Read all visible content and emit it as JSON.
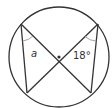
{
  "diagram": {
    "type": "circle-inscribed-angles",
    "colors": {
      "stroke": "#333333",
      "background": "#ffffff",
      "arc": "#999999"
    },
    "circle": {
      "cx": 59,
      "cy": 57,
      "r": 50
    },
    "center_dot": {
      "x": 59,
      "y": 57,
      "r": 1.6
    },
    "points": {
      "top_left": {
        "x": 21,
        "y": 24
      },
      "top_right": {
        "x": 98,
        "y": 24
      },
      "bottom_left": {
        "x": 27,
        "y": 93
      },
      "bottom_right": {
        "x": 91,
        "y": 93
      }
    },
    "labels": {
      "angle_left": {
        "text": "a",
        "x": 31,
        "y": 57
      },
      "angle_right": {
        "text": "18°",
        "x": 73,
        "y": 59
      }
    }
  }
}
